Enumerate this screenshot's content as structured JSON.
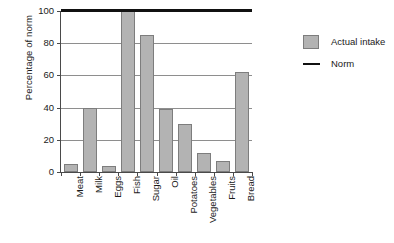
{
  "chart_data": {
    "type": "bar",
    "title": "",
    "xlabel": "",
    "ylabel": "Percentage of norm",
    "ylim": [
      0,
      100
    ],
    "yticks": [
      0,
      20,
      40,
      60,
      80,
      100
    ],
    "grid": true,
    "categories": [
      "Meat",
      "Milk",
      "Eggs",
      "Fish",
      "Sugar",
      "Oil",
      "Potatoes",
      "Vegetables",
      "Fruits",
      "Bread"
    ],
    "series": [
      {
        "name": "Actual intake",
        "type": "bar",
        "color": "#b3b3b3",
        "values": [
          5,
          40,
          4,
          100,
          85,
          39,
          30,
          12,
          7,
          62
        ]
      },
      {
        "name": "Norm",
        "type": "line",
        "color": "#111111",
        "value": 100,
        "values": [
          100,
          100,
          100,
          100,
          100,
          100,
          100,
          100,
          100,
          100
        ]
      }
    ],
    "legend": {
      "position": "right",
      "entries": [
        {
          "label": "Actual intake",
          "marker": "square",
          "color": "#b3b3b3"
        },
        {
          "label": "Norm",
          "marker": "line",
          "color": "#111111"
        }
      ]
    }
  },
  "axes": {
    "y_title": "Percentage of norm",
    "y_tick_labels": [
      "0",
      "20",
      "40",
      "60",
      "80",
      "100"
    ]
  },
  "legend": {
    "actual_intake_label": "Actual intake",
    "norm_label": "Norm"
  },
  "colors": {
    "bar_fill": "#b3b3b3",
    "bar_stroke": "#7d7d7d",
    "norm_line": "#111111",
    "gridline": "#8e8e8e",
    "axis": "#4a4a4a",
    "background": "#ffffff"
  }
}
